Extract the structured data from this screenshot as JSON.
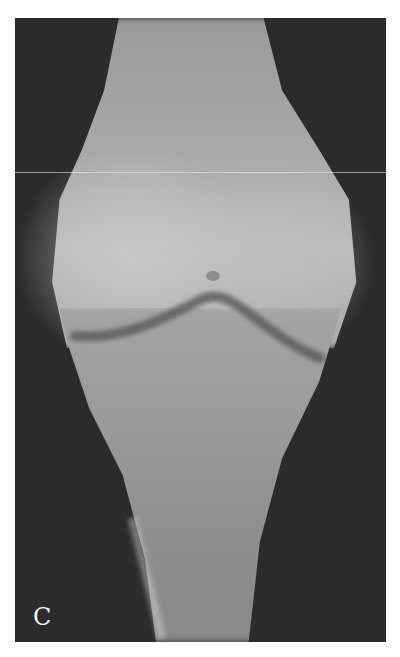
{
  "figure": {
    "panel_label": "C",
    "colors": {
      "background": "#ffffff",
      "film_dark": "#2b2b2b",
      "bone": "#a8a8a8",
      "joint_line": "#555555",
      "label": "#f2f2f2"
    }
  }
}
